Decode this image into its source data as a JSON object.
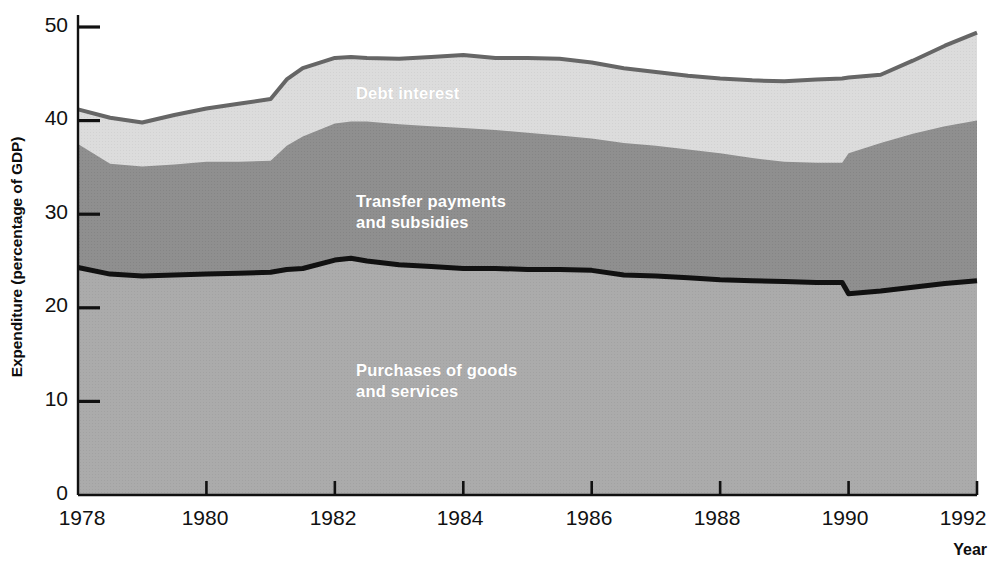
{
  "chart_data": {
    "type": "area",
    "title": "",
    "subtitle": "",
    "xlabel": "Year",
    "ylabel": "Expenditure (percentage of GDP)",
    "stacked": true,
    "grid": false,
    "legend_position": "inline-band-labels",
    "xlim": [
      1978,
      1992
    ],
    "ylim": [
      0,
      50
    ],
    "xticks": [
      1978,
      1980,
      1982,
      1984,
      1986,
      1988,
      1990,
      1992
    ],
    "xtick_labels": [
      "1978",
      "1980",
      "1982",
      "1984",
      "1986",
      "1988",
      "1990",
      "1992"
    ],
    "yticks": [
      0,
      10,
      20,
      30,
      40,
      50
    ],
    "ytick_labels": [
      "0",
      "10",
      "20",
      "30",
      "40",
      "50"
    ],
    "x": [
      1978,
      1978.5,
      1979,
      1979.5,
      1980,
      1980.5,
      1981,
      1981.25,
      1981.5,
      1982,
      1982.25,
      1982.5,
      1983,
      1983.5,
      1984,
      1984.5,
      1985,
      1985.5,
      1986,
      1986.5,
      1987,
      1987.5,
      1988,
      1988.5,
      1989,
      1989.5,
      1989.9,
      1990,
      1990.5,
      1991,
      1991.5,
      1992
    ],
    "series": [
      {
        "name": "Purchases of goods and services",
        "color": "#ababab",
        "label_text": "Purchases of goods\nand services",
        "cumulative_top": [
          24.3,
          23.6,
          23.4,
          23.5,
          23.6,
          23.7,
          23.8,
          24.1,
          24.2,
          25.1,
          25.3,
          25.0,
          24.6,
          24.4,
          24.2,
          24.2,
          24.1,
          24.1,
          24.0,
          23.5,
          23.4,
          23.2,
          23.0,
          22.9,
          22.8,
          22.7,
          22.7,
          21.5,
          21.8,
          22.2,
          22.6,
          22.9
        ],
        "values": [
          24.3,
          23.6,
          23.4,
          23.5,
          23.6,
          23.7,
          23.8,
          24.1,
          24.2,
          25.1,
          25.3,
          25.0,
          24.6,
          24.4,
          24.2,
          24.2,
          24.1,
          24.1,
          24.0,
          23.5,
          23.4,
          23.2,
          23.0,
          22.9,
          22.8,
          22.7,
          22.7,
          21.5,
          21.8,
          22.2,
          22.6,
          22.9
        ]
      },
      {
        "name": "Transfer payments and subsidies",
        "color": "#8f8f8f",
        "label_text": "Transfer payments\nand subsidies",
        "cumulative_top": [
          37.5,
          35.4,
          35.1,
          35.3,
          35.6,
          35.6,
          35.7,
          37.3,
          38.3,
          39.7,
          39.9,
          39.9,
          39.6,
          39.4,
          39.2,
          39.0,
          38.7,
          38.4,
          38.1,
          37.6,
          37.3,
          36.9,
          36.5,
          36.0,
          35.6,
          35.5,
          35.5,
          36.5,
          37.6,
          38.6,
          39.4,
          40.0
        ],
        "values": [
          13.2,
          11.8,
          11.7,
          11.8,
          12.0,
          11.9,
          11.9,
          13.2,
          14.1,
          14.6,
          14.6,
          14.9,
          15.0,
          15.0,
          15.0,
          14.8,
          14.6,
          14.3,
          14.1,
          14.1,
          13.9,
          13.7,
          13.5,
          13.1,
          12.8,
          12.8,
          12.8,
          15.0,
          15.8,
          16.4,
          16.8,
          17.1
        ]
      },
      {
        "name": "Debt interest",
        "color": "#dcdcdc",
        "label_text": "Debt interest",
        "cumulative_top": [
          41.2,
          40.3,
          39.8,
          40.6,
          41.3,
          41.8,
          42.3,
          44.4,
          45.6,
          46.7,
          46.8,
          46.7,
          46.6,
          46.8,
          47.0,
          46.7,
          46.7,
          46.6,
          46.2,
          45.6,
          45.2,
          44.8,
          44.5,
          44.3,
          44.2,
          44.4,
          44.5,
          44.6,
          44.9,
          46.4,
          48.0,
          49.4
        ],
        "values": [
          3.7,
          4.9,
          4.7,
          5.3,
          5.7,
          6.2,
          6.6,
          7.1,
          7.3,
          7.0,
          6.9,
          6.8,
          7.0,
          7.4,
          7.8,
          7.7,
          8.0,
          8.2,
          8.1,
          8.0,
          7.9,
          7.9,
          8.0,
          8.3,
          8.6,
          8.9,
          9.0,
          8.1,
          7.3,
          7.8,
          8.6,
          9.4
        ]
      }
    ],
    "annotations": [
      {
        "text": "Debt interest",
        "x": 1983.0,
        "y": 43.8
      },
      {
        "text": "Transfer payments\nand subsidies",
        "x": 1983.0,
        "y": 32.2
      },
      {
        "text": "Purchases of goods\nand services",
        "x": 1983.0,
        "y": 14.2
      }
    ],
    "styling": {
      "top_outline_color": "#666666",
      "bottom_series_outline_color": "#111111",
      "axis_color": "#111111",
      "background": "#ffffff"
    }
  }
}
